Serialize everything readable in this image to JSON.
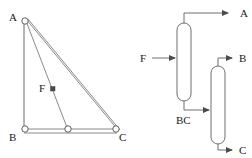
{
  "figure": {
    "panels": [
      {
        "id": "triangle-diagram",
        "name": "ternary-composition-triangle",
        "labels": {
          "vertex_a": "A",
          "vertex_b": "B",
          "vertex_c": "C",
          "feed_point": "F"
        },
        "geometry": {
          "a": {
            "x": 24,
            "y": 19
          },
          "b": {
            "x": 24,
            "y": 131
          },
          "c": {
            "x": 117,
            "y": 131
          },
          "mid_bc": {
            "x": 68,
            "y": 131
          },
          "f_point": {
            "x": 52,
            "y": 90
          }
        }
      },
      {
        "id": "flowsheet-diagram",
        "name": "two-column-distillation-flowsheet",
        "streams": {
          "feed": "F",
          "column1_overhead": "A",
          "column1_bottoms": "BC",
          "column2_overhead": "B",
          "column2_bottoms": "C"
        },
        "units": [
          {
            "id": "column-1",
            "label": ""
          },
          {
            "id": "column-2",
            "label": ""
          }
        ]
      }
    ]
  },
  "colors": {
    "line": "#6b6b6b",
    "text": "#1a1a1a",
    "background": "#ffffff",
    "marker_fill": "#4a4a4a"
  }
}
